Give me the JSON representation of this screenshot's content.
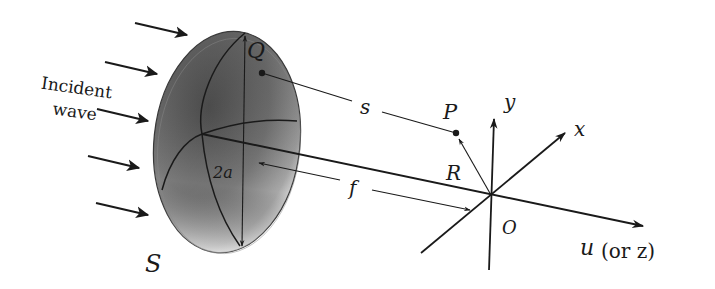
{
  "diagram": {
    "labels": {
      "incident_line1": "Incident",
      "incident_line2": "wave",
      "Q": "Q",
      "S": "S",
      "two_a": "2a",
      "s": "s",
      "P": "P",
      "R": "R",
      "f": "f",
      "y": "y",
      "x": "x",
      "O": "O",
      "u": "u",
      "u_paren": "(or z)"
    },
    "colors": {
      "ink": "#1a1a1a",
      "aperture_dark": "#4a4a4a",
      "aperture_mid": "#7d7d7d",
      "aperture_light": "#e8e8e8",
      "background": "#ffffff"
    },
    "elements": {
      "aperture": "elliptical aperture S of diameter 2a",
      "incident_arrows": 5,
      "point_Q": "source point on aperture",
      "point_P": "observation point",
      "origin": "focal point O",
      "axes": [
        "x",
        "y",
        "u (or z)"
      ]
    }
  }
}
